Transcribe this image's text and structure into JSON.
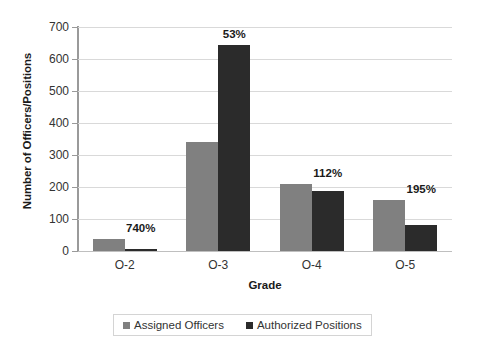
{
  "chart_data": {
    "type": "bar",
    "title": "",
    "xlabel": "Grade",
    "ylabel": "Number of Officers/Positions",
    "categories": [
      "O-2",
      "O-3",
      "O-4",
      "O-5"
    ],
    "series": [
      {
        "name": "Assigned Officers",
        "color": "#808080",
        "values": [
          37,
          342,
          210,
          160
        ]
      },
      {
        "name": "Authorized Positions",
        "color": "#2b2b2b",
        "values": [
          5,
          645,
          188,
          82
        ]
      }
    ],
    "data_labels": [
      "740%",
      "53%",
      "112%",
      "195%"
    ],
    "ylim": [
      0,
      700
    ],
    "yticks": [
      0,
      100,
      200,
      300,
      400,
      500,
      600,
      700
    ],
    "ytick_labels": [
      "0",
      "100",
      "200",
      "300",
      "400",
      "500",
      "600",
      "700"
    ],
    "grid": true,
    "legend_position": "bottom"
  }
}
